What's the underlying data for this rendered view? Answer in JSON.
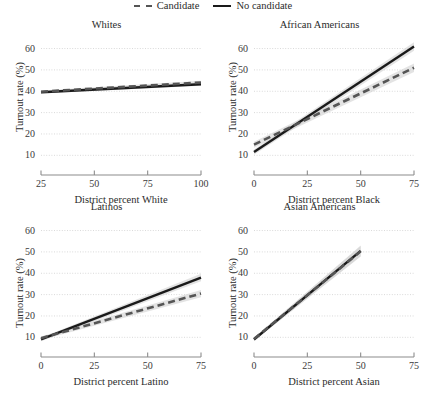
{
  "legend": {
    "items": [
      {
        "label": "Candidate",
        "style": "dashed",
        "color": "#555555",
        "icon": "dashed-line-icon"
      },
      {
        "label": "No candidate",
        "style": "solid",
        "color": "#1a1a1a",
        "icon": "solid-line-icon"
      }
    ]
  },
  "axis": {
    "ylabel": "Turnout rate (%)",
    "yticks": [
      10,
      20,
      30,
      40,
      50,
      60
    ],
    "ylim": [
      5,
      64
    ]
  },
  "chart_data": [
    {
      "type": "line",
      "title": "Whites",
      "xlabel": "District percent White",
      "ylabel": "Turnout rate (%)",
      "xlim": [
        25,
        100
      ],
      "ylim": [
        5,
        64
      ],
      "xticks": [
        25,
        50,
        75,
        100
      ],
      "yticks": [
        10,
        20,
        30,
        40,
        50,
        60
      ],
      "grid": true,
      "series": [
        {
          "name": "No candidate",
          "style": "solid",
          "color": "#1a1a1a",
          "x": [
            25,
            100
          ],
          "values": [
            39.5,
            43.3
          ],
          "band_lower": [
            39.0,
            42.6
          ],
          "band_upper": [
            40.0,
            44.0
          ]
        },
        {
          "name": "Candidate",
          "style": "dashed",
          "color": "#555555",
          "x": [
            25,
            100
          ],
          "values": [
            39.8,
            44.1
          ],
          "band_lower": [
            39.2,
            43.3
          ],
          "band_upper": [
            40.4,
            44.9
          ]
        }
      ]
    },
    {
      "type": "line",
      "title": "African Americans",
      "xlabel": "District percent Black",
      "ylabel": "Turnout rate (%)",
      "xlim": [
        0,
        75
      ],
      "ylim": [
        5,
        64
      ],
      "xticks": [
        0,
        25,
        50,
        75
      ],
      "yticks": [
        10,
        20,
        30,
        40,
        50,
        60
      ],
      "grid": true,
      "series": [
        {
          "name": "No candidate",
          "style": "solid",
          "color": "#1a1a1a",
          "x": [
            0,
            75
          ],
          "values": [
            11.5,
            61.0
          ],
          "band_lower": [
            10.3,
            59.0
          ],
          "band_upper": [
            12.7,
            63.0
          ]
        },
        {
          "name": "Candidate",
          "style": "dashed",
          "color": "#555555",
          "x": [
            0,
            75
          ],
          "values": [
            15.0,
            51.0
          ],
          "band_lower": [
            13.6,
            49.0
          ],
          "band_upper": [
            16.4,
            53.0
          ]
        }
      ]
    },
    {
      "type": "line",
      "title": "Latinos",
      "xlabel": "District percent Latino",
      "ylabel": "Turnout rate (%)",
      "xlim": [
        0,
        75
      ],
      "ylim": [
        5,
        64
      ],
      "xticks": [
        0,
        25,
        50,
        75
      ],
      "yticks": [
        10,
        20,
        30,
        40,
        50,
        60
      ],
      "grid": true,
      "series": [
        {
          "name": "No candidate",
          "style": "solid",
          "color": "#1a1a1a",
          "x": [
            0,
            75
          ],
          "values": [
            9.0,
            38.0
          ],
          "band_lower": [
            8.2,
            36.2
          ],
          "band_upper": [
            9.8,
            39.8
          ]
        },
        {
          "name": "Candidate",
          "style": "dashed",
          "color": "#555555",
          "x": [
            0,
            75
          ],
          "values": [
            9.6,
            30.5
          ],
          "band_lower": [
            8.8,
            28.8
          ],
          "band_upper": [
            10.4,
            32.2
          ]
        }
      ]
    },
    {
      "type": "line",
      "title": "Asian Americans",
      "xlabel": "District percent Asian",
      "ylabel": "Turnout rate (%)",
      "xlim": [
        0,
        75
      ],
      "ylim": [
        5,
        64
      ],
      "xticks": [
        0,
        25,
        50,
        75
      ],
      "yticks": [
        10,
        20,
        30,
        40,
        50,
        60
      ],
      "grid": true,
      "series": [
        {
          "name": "No candidate",
          "style": "solid",
          "color": "#1a1a1a",
          "x": [
            0,
            50
          ],
          "values": [
            9.0,
            50.5
          ],
          "band_lower": [
            8.3,
            48.0
          ],
          "band_upper": [
            9.7,
            53.0
          ]
        },
        {
          "name": "Candidate",
          "style": "dashed",
          "color": "#555555",
          "x": [
            0,
            50
          ],
          "values": [
            9.2,
            50.3
          ],
          "band_lower": [
            8.5,
            47.8
          ],
          "band_upper": [
            9.9,
            52.8
          ]
        }
      ]
    }
  ],
  "style": {
    "grid_color": "#d9d9d9",
    "axis_color": "#8c8c8c",
    "band_color": "#d4d4d4",
    "text_color": "#2b2b2b"
  }
}
